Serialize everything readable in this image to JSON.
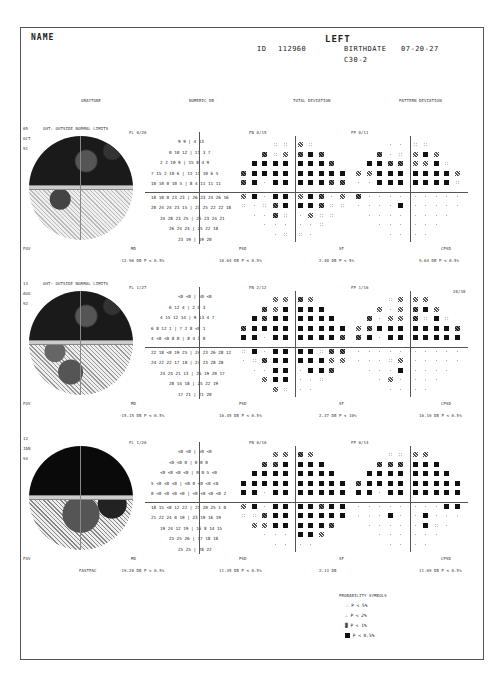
{
  "header": {
    "name_label": "NAME",
    "eye": "LEFT",
    "id_label": "ID",
    "id_value": "112960",
    "birthdate_label": "BIRTHDATE",
    "birthdate_value": "07-20-27",
    "program": "C30-2"
  },
  "column_headers": {
    "graytone": "GRAYTONE",
    "numeric": "NUMERIC DB",
    "total_deviation": "TOTAL DEVIATION",
    "pattern_deviation": "PATTERN DEVIATION"
  },
  "tests": [
    {
      "day": "05",
      "month": "OCT",
      "year": "91",
      "ght": "GHT: OUTSIDE NORMAL LIMITS",
      "fl": "FL  0/20",
      "fn": "FN  0/15",
      "fp": "FP  0/11",
      "fov": "FOV",
      "md_label": "MD",
      "md_value": "-12.96 DB   P < 0.5%",
      "psd_label": "PSD",
      "psd_value": "10.04 DB   P < 0.5%",
      "sf_label": "SF",
      "sf_value": "2.48 DB   P <  5%",
      "cpsd_label": "CPSD",
      "cpsd_value": "9.64 DB   P < 0.5%",
      "extra": "",
      "fastpac": ""
    },
    {
      "day": "13",
      "month": "AUG",
      "year": "92",
      "ght": "GHT: OUTSIDE NORMAL LIMITS",
      "fl": "FL  1/27",
      "fn": "FN  2/12",
      "fp": "FP  1/16",
      "fov": "FOV",
      "md_label": "MD",
      "md_value": "-15.15 DB   P < 0.5%",
      "psd_label": "PSD",
      "psd_value": "10.45 DB   P < 0.5%",
      "sf_label": "SF",
      "sf_value": "2.37 DB   P <  10%",
      "cpsd_label": "CPSD",
      "cpsd_value": "10.10 DB   P < 0.5%",
      "extra": "28/38",
      "fastpac": ""
    },
    {
      "day": "12",
      "month": "JAN",
      "year": "94",
      "ght": "",
      "fl": "FL  1/20",
      "fn": "FN  0/10",
      "fp": "FP  0/14",
      "fov": "FOV",
      "md_label": "MD",
      "md_value": "-19.28 DB   P < 0.5%",
      "psd_label": "PSD",
      "psd_value": "11.35 DB   P < 0.5%",
      "sf_label": "SF",
      "sf_value": "2.13 DB",
      "cpsd_label": "CPSD",
      "cpsd_value": "11.09 DB   P < 0.5%",
      "extra": "",
      "fastpac": "FASTPAC"
    }
  ],
  "numeric_rows": [
    [
      "9 9 | 4 13",
      "0 10 12 | 11 3 7",
      "2 2 10 9 | 15 8 4 9",
      "7 15 2 10 6 | 11 11 10 6 5",
      "10 10 0 10 5 | 8 4 11 11 11",
      "18 10 0 23 23 | 26 23 24 26 16",
      "20 24 24 23 15 | 23 25 22 22 18",
      "24 28 23 25 | 26 23 24 21",
      "26 24 24 | 25 22 18",
      "23 19 | 19 20"
    ],
    [
      "<0 <0 | <0 <0",
      "6 12 4 | 2 0 3",
      "4 15 12 14 | 9 13 4 7",
      "6 8 12 1 | 7 2 8 <0 1",
      "4 <0 <0 8 0 | 8 4 3 0",
      "22 18 <0 19 25 | 24 23 26 28 12",
      "24 22 22 17 18 | 27 23 28 28",
      "24 24 21 13 | 26 19 20 17",
      "28 14 18 | 25 22 19",
      "17 21 | 21 20"
    ],
    [
      "<0 <0 | <0 <0",
      "<0 <0 0 | 0 0 0",
      "<0 <0 <0 <0 | 0 0 5 <0",
      "5 <0 <0 <0 | <0 0 <0 <0 <0",
      "0 <0 <0 <0 <0 | <0 <0 <0 <0 2",
      "18 15 <0 12 22 | 21 20 25 1 0",
      "21 22 24 0 19 | 23 19 16 19",
      "19 24 12 19 | 16 8 14 15",
      "25 25 26 | 17 18 18",
      "25 25 | 28 22"
    ]
  ],
  "legend": {
    "title": "PROBABILITY SYMBOLS",
    "items": [
      {
        "symbol": "::",
        "label": "P <  5%"
      },
      {
        "symbol": "∴",
        "label": "P <  2%"
      },
      {
        "symbol": "▓",
        "label": "P <  1%"
      },
      {
        "symbol": "■",
        "label": "P < 0.5%"
      }
    ]
  }
}
